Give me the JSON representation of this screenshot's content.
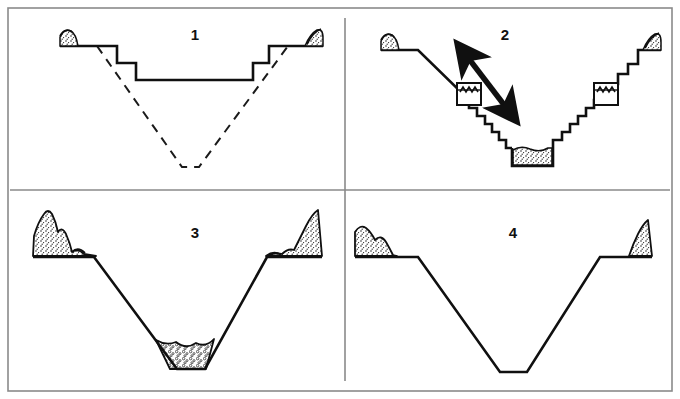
{
  "figure": {
    "frame_color": "#8a8a8a",
    "line_color": "#101010",
    "fill_stipple_color": "#111111",
    "background": "#ffffff",
    "panel_count": 4,
    "layout": "2x2 grid with vertical divider and horizontal divider"
  },
  "panels": [
    {
      "id": "panel-1",
      "number": "1",
      "number_x": 195,
      "number_y": 36,
      "caption": "Stepped bench excavation over original V-shaped valley (dashed)",
      "features": [
        "ground-surface-line-left",
        "ground-surface-line-right",
        "stepped-bench-profile-solid",
        "original-valley-outline-dashed",
        "hatch-mound-left",
        "hatch-mound-right"
      ],
      "line_style_primary": "solid",
      "line_style_secondary": "dashed"
    },
    {
      "id": "panel-2",
      "number": "2",
      "number_x": 505,
      "number_y": 36,
      "caption": "Terraced staircase slopes with machine symbols, working-direction arrow and sediment basin",
      "features": [
        "ground-surface-line-left",
        "ground-surface-line-right",
        "smooth-slope-left",
        "staircase-slope-left",
        "staircase-slope-right",
        "machine-box-left",
        "machine-box-right",
        "double-headed-arrow",
        "sediment-basin-stipple",
        "hatch-mound-left",
        "hatch-mound-right"
      ],
      "line_style_primary": "solid",
      "arrow": {
        "name": "double-headed-arrow",
        "direction": "diagonal lower-right to upper-left",
        "heads": 2
      },
      "machine_symbol": {
        "name": "sawtooth-box",
        "description": "square box containing sawtooth zigzag line",
        "count": 2
      }
    },
    {
      "id": "panel-3",
      "number": "3",
      "number_x": 195,
      "number_y": 234,
      "caption": "Trapezoidal channel with spoil piles on both banks and aggraded sediment in the bed",
      "features": [
        "berm-left",
        "berm-right",
        "trapezoidal-cut-profile",
        "spoil-pile-left-stipple",
        "spoil-pile-right-stipple",
        "bed-sediment-stipple"
      ],
      "line_style_primary": "solid"
    },
    {
      "id": "panel-4",
      "number": "4",
      "number_x": 513,
      "number_y": 234,
      "caption": "Clean trapezoidal channel with small spoil piles and no bed sediment",
      "features": [
        "berm-left",
        "berm-right",
        "trapezoidal-cut-profile",
        "spoil-pile-left-stipple",
        "spoil-pile-right-stipple"
      ],
      "line_style_primary": "solid"
    }
  ]
}
